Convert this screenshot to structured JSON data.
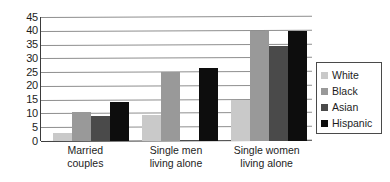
{
  "chart_data": {
    "type": "bar",
    "title": "",
    "subtitle": "",
    "xlabel": "",
    "ylabel": "",
    "ylim": [
      0,
      45
    ],
    "ytick_step": 5,
    "yticks": [
      45,
      40,
      35,
      30,
      25,
      20,
      15,
      10,
      5,
      0
    ],
    "grid": true,
    "grid_axis": "y",
    "legend_position": "right",
    "categories": [
      "Married couples",
      "Single men living alone",
      "Single women living alone"
    ],
    "category_lines": [
      [
        "Married",
        "couples"
      ],
      [
        "Single men",
        "living alone"
      ],
      [
        "Single women",
        "living alone"
      ]
    ],
    "series": [
      {
        "name": "White",
        "color": "#c9c9c9",
        "values": [
          3,
          9.5,
          15
        ]
      },
      {
        "name": "Black",
        "color": "#999999",
        "values": [
          10.5,
          25,
          40
        ]
      },
      {
        "name": "Asian",
        "color": "#4a4a4a",
        "values": [
          9,
          0.5,
          34.5
        ]
      },
      {
        "name": "Hispanic",
        "color": "#0d0d0d",
        "values": [
          14,
          26.5,
          40
        ]
      }
    ]
  },
  "legend": {
    "items": [
      {
        "label": "White",
        "color": "#c9c9c9"
      },
      {
        "label": "Black",
        "color": "#999999"
      },
      {
        "label": "Asian",
        "color": "#4a4a4a"
      },
      {
        "label": "Hispanic",
        "color": "#0d0d0d"
      }
    ]
  },
  "colors": {
    "axis": "#3b3b3b",
    "gridline": "#8e8e8e",
    "text": "#1d1d1d",
    "background": "#ffffff",
    "legend_border": "#4a4a4a"
  }
}
